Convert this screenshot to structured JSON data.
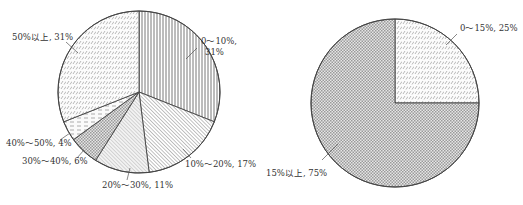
{
  "chart_data": [
    {
      "type": "pie",
      "title": "",
      "start_angle_deg": 0,
      "direction": "clockwise",
      "center": [
        139,
        92
      ],
      "radius": 81,
      "slices": [
        {
          "label": "0～10%, 31%",
          "label_lines": [
            "0～10%,",
            "31%"
          ],
          "category": "0～10%",
          "value": 31,
          "pattern": "vertical-lines",
          "label_pos": [
            201,
            44
          ],
          "leader": [
            [
              197,
              48
            ],
            [
              186,
              59
            ]
          ]
        },
        {
          "label": "10%～20%, 17%",
          "label_lines": [
            "10%～20%, 17%"
          ],
          "category": "10%～20%",
          "value": 17,
          "pattern": "diagonal-dense",
          "label_pos": [
            185,
            167
          ],
          "leader": [
            [
              191,
              158
            ],
            [
              183,
              149
            ]
          ]
        },
        {
          "label": "20%～30%, 11%",
          "label_lines": [
            "20%～30%, 11%"
          ],
          "category": "20%～30%",
          "value": 11,
          "pattern": "diagonal-light",
          "label_pos": [
            102,
            188
          ],
          "leader": [
            [
              127,
              180
            ],
            [
              130,
              168
            ]
          ]
        },
        {
          "label": "30%～40%, 6%",
          "label_lines": [
            "30%～40%, 6%"
          ],
          "category": "30%～40%",
          "value": 6,
          "pattern": "checker",
          "label_pos": [
            22,
            164
          ],
          "leader": [
            [
              77,
              158
            ],
            [
              84,
              150
            ]
          ]
        },
        {
          "label": "40%～50%, 4%",
          "label_lines": [
            "40%～50%, 4%"
          ],
          "category": "40%～50%",
          "value": 4,
          "pattern": "horizontal-dashes",
          "label_pos": [
            6,
            146
          ],
          "leader": [
            [
              60,
              140
            ],
            [
              70,
              133
            ]
          ]
        },
        {
          "label": "50%以上, 31%",
          "label_lines": [
            "50%以上, 31%"
          ],
          "category": "50%以上",
          "value": 31,
          "pattern": "slant-dashes",
          "label_pos": [
            12,
            40
          ],
          "leader": [
            [
              66,
              42
            ],
            [
              78,
              53
            ]
          ]
        }
      ]
    },
    {
      "type": "pie",
      "title": "",
      "start_angle_deg": 0,
      "direction": "clockwise",
      "center": [
        395,
        103
      ],
      "radius": 84,
      "slices": [
        {
          "label": "0～15%, 25%",
          "label_lines": [
            "0～15%, 25%"
          ],
          "category": "0～15%",
          "value": 25,
          "pattern": "slant-dashes",
          "label_pos": [
            460,
            31
          ],
          "leader": [
            [
              457,
              34
            ],
            [
              446,
              45
            ]
          ]
        },
        {
          "label": "15%以上, 75%",
          "label_lines": [
            "15%以上, 75%"
          ],
          "category": "15%以上",
          "value": 75,
          "pattern": "checker",
          "label_pos": [
            266,
            176
          ],
          "leader": [
            [
              322,
              160
            ],
            [
              338,
              144
            ]
          ]
        }
      ]
    }
  ],
  "colors": {
    "outline": "#444444",
    "hatch": "#6a6a6a",
    "label": "#333333",
    "background": "#ffffff"
  }
}
